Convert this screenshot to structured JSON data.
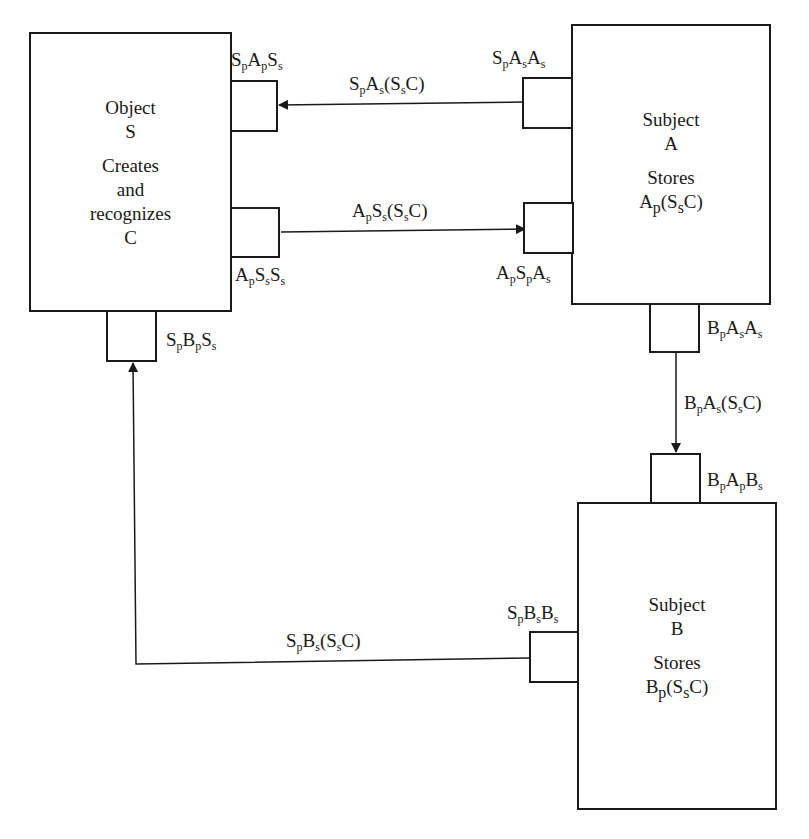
{
  "object_s": {
    "lines": [
      "Object",
      "S",
      "",
      "Creates",
      "and",
      "recognizes",
      "C"
    ]
  },
  "subject_a": {
    "line1": "Subject",
    "line2": "A",
    "line3": "Stores",
    "line4": {
      "base": "A",
      "sub": "p",
      "rest1": "(S",
      "sub2": "s",
      "rest2": "C)"
    }
  },
  "subject_b": {
    "line1": "Subject",
    "line2": "B",
    "line3": "Stores",
    "line4": {
      "base": "B",
      "sub": "p",
      "rest1": "(S",
      "sub2": "s",
      "rest2": "C)"
    }
  },
  "ports": {
    "s_pas": {
      "parts": [
        [
          "S",
          "p"
        ],
        [
          "A",
          "p"
        ],
        [
          "S",
          "s"
        ]
      ]
    },
    "a_pss": {
      "parts": [
        [
          "A",
          "p"
        ],
        [
          "S",
          "s"
        ],
        [
          "S",
          "s"
        ]
      ]
    },
    "s_pbs": {
      "parts": [
        [
          "S",
          "p"
        ],
        [
          "B",
          "p"
        ],
        [
          "S",
          "s"
        ]
      ]
    },
    "a_sas": {
      "parts": [
        [
          "S",
          "p"
        ],
        [
          "A",
          "s"
        ],
        [
          "A",
          "s"
        ]
      ]
    },
    "a_psp": {
      "parts": [
        [
          "A",
          "p"
        ],
        [
          "S",
          "p"
        ],
        [
          "A",
          "s"
        ]
      ]
    },
    "b_paa": {
      "parts": [
        [
          "B",
          "p"
        ],
        [
          "A",
          "s"
        ],
        [
          "A",
          "s"
        ]
      ]
    },
    "b_pab": {
      "parts": [
        [
          "B",
          "p"
        ],
        [
          "A",
          "p"
        ],
        [
          "B",
          "s"
        ]
      ]
    },
    "s_pbb": {
      "parts": [
        [
          "S",
          "p"
        ],
        [
          "B",
          "s"
        ],
        [
          "B",
          "s"
        ]
      ]
    }
  },
  "messages": {
    "a_to_s": {
      "parts": [
        [
          "S",
          "p"
        ],
        [
          "A",
          "s"
        ],
        [
          "(S",
          "s"
        ],
        [
          "C)",
          ""
        ]
      ]
    },
    "s_to_a": {
      "parts": [
        [
          "A",
          "p"
        ],
        [
          "S",
          "s"
        ],
        [
          "(S",
          "s"
        ],
        [
          "C)",
          ""
        ]
      ]
    },
    "a_to_b": {
      "parts": [
        [
          "B",
          "p"
        ],
        [
          "A",
          "s"
        ],
        [
          "(S",
          "s"
        ],
        [
          "C)",
          ""
        ]
      ]
    },
    "b_to_s": {
      "parts": [
        [
          "S",
          "p"
        ],
        [
          "B",
          "s"
        ],
        [
          "(S",
          "s"
        ],
        [
          "C)",
          ""
        ]
      ]
    }
  },
  "colors": {
    "ink": "#1a1a1a",
    "background": "#ffffff"
  }
}
